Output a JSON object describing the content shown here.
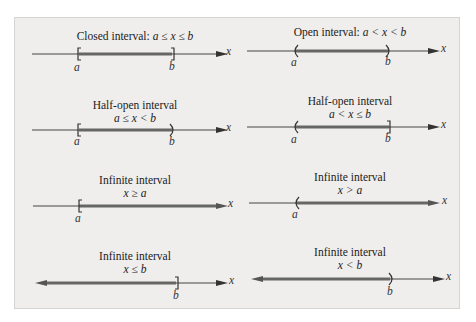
{
  "figure": {
    "background": "#efeeec",
    "axis_color": "#444444",
    "interval_color": "#666666",
    "axis_label": "x",
    "panels": [
      {
        "title": "Closed interval: ",
        "condition": "a ≤ x ≤ b",
        "left": "a",
        "right": "b",
        "left_end": "[",
        "right_end": "]"
      },
      {
        "title": "Open interval: ",
        "condition": "a < x < b",
        "left": "a",
        "right": "b",
        "left_end": "(",
        "right_end": ")"
      },
      {
        "title": "Half-open interval",
        "condition": "a ≤ x < b",
        "left": "a",
        "right": "b",
        "left_end": "[",
        "right_end": ")"
      },
      {
        "title": "Half-open interval",
        "condition": "a < x ≤ b",
        "left": "a",
        "right": "b",
        "left_end": "(",
        "right_end": "]"
      },
      {
        "title": "Infinite interval",
        "condition": "x ≥ a",
        "left": "a",
        "right": "",
        "left_end": "[",
        "right_end": "→"
      },
      {
        "title": "Infinite interval",
        "condition": "x > a",
        "left": "a",
        "right": "",
        "left_end": "(",
        "right_end": "→"
      },
      {
        "title": "Infinite interval",
        "condition": "x ≤ b",
        "left": "",
        "right": "b",
        "left_end": "←",
        "right_end": "]"
      },
      {
        "title": "Infinite interval",
        "condition": "x < b",
        "left": "",
        "right": "b",
        "left_end": "←",
        "right_end": ")"
      }
    ]
  }
}
